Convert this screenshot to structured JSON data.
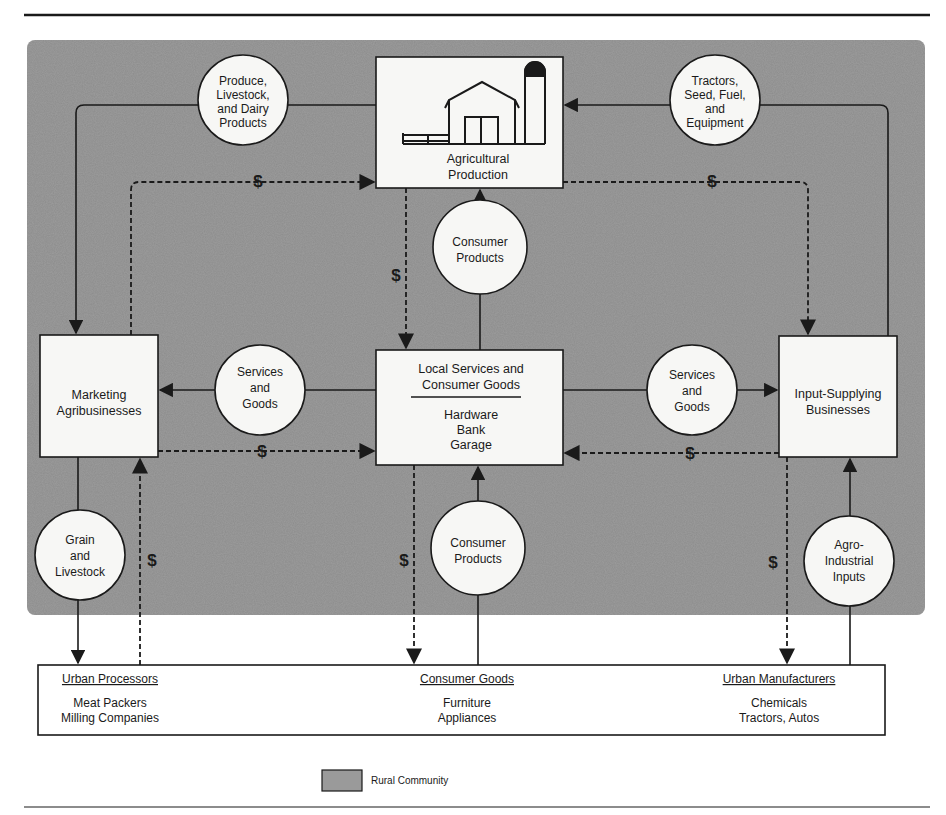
{
  "diagram": {
    "type": "flow",
    "background_region_label": "Rural Community",
    "colors": {
      "rural_panel": "#8c8c8c",
      "node_fill": "#f7f7f5",
      "line": "#1a1a1a"
    },
    "boxes": {
      "agricultural_production": {
        "line1": "Agricultural",
        "line2": "Production",
        "icon": "barn-silo-icon"
      },
      "marketing": {
        "line1": "Marketing",
        "line2": "Agribusinesses"
      },
      "local_services": {
        "title1": "Local Services and",
        "title2": "Consumer Goods",
        "items": [
          "Hardware",
          "Bank",
          "Garage"
        ]
      },
      "input_supplying": {
        "line1": "Input-Supplying",
        "line2": "Businesses"
      },
      "urban_processors": {
        "title": "Urban Processors",
        "items": [
          "Meat Packers",
          "Milling Companies"
        ]
      },
      "consumer_goods": {
        "title": "Consumer Goods",
        "items": [
          "Furniture",
          "Appliances"
        ]
      },
      "urban_manufacturers": {
        "title": "Urban Manufacturers",
        "items": [
          "Chemicals",
          "Tractors, Autos"
        ]
      }
    },
    "circles": {
      "produce": [
        "Produce,",
        "Livestock,",
        "and Dairy",
        "Products"
      ],
      "tractors": [
        "Tractors,",
        "Seed, Fuel,",
        "and",
        "Equipment"
      ],
      "consumer_products_top": [
        "Consumer",
        "Products"
      ],
      "services_left": [
        "Services",
        "and",
        "Goods"
      ],
      "services_right": [
        "Services",
        "and",
        "Goods"
      ],
      "grain": [
        "Grain",
        "and",
        "Livestock"
      ],
      "consumer_products_bottom": [
        "Consumer",
        "Products"
      ],
      "agro_inputs": [
        "Agro-",
        "Industrial",
        "Inputs"
      ]
    },
    "money_symbol": "$",
    "legend": {
      "label": "Rural Community"
    }
  }
}
